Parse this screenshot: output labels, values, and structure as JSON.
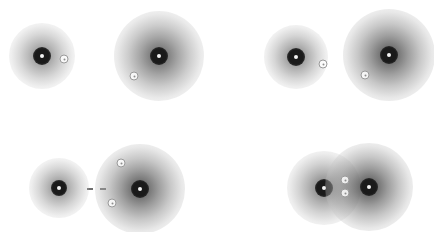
{
  "figure": {
    "width": 434,
    "height": 232,
    "background_color": "#ffffff",
    "colormap": "inverted-grayscale",
    "source_color": "#1a1a1a",
    "halo_color": "#bdbdbd",
    "marker_color": "#9a9a9a",
    "connector_color": "#6f6f6f"
  },
  "panels": [
    {
      "id": "panel-top-left",
      "sources": [
        {
          "name": "source-a1",
          "cx": 42,
          "cy": 56,
          "halo_r": 33,
          "core_r": 9,
          "nucleus_r": 2,
          "peak": 1.0,
          "halo_opacity": 0.55
        },
        {
          "name": "source-a2",
          "cx": 159,
          "cy": 56,
          "halo_r": 45,
          "core_r": 9,
          "nucleus_r": 2,
          "peak": 1.0,
          "halo_opacity": 0.72
        }
      ],
      "markers": [
        {
          "name": "marker-a1",
          "cx": 64,
          "cy": 59,
          "r": 4.5
        },
        {
          "name": "marker-a2",
          "cx": 134,
          "cy": 76,
          "r": 4.5
        }
      ],
      "connectors": []
    },
    {
      "id": "panel-top-right",
      "sources": [
        {
          "name": "source-b1",
          "cx": 296,
          "cy": 57,
          "halo_r": 32,
          "core_r": 9,
          "nucleus_r": 2,
          "peak": 1.0,
          "halo_opacity": 0.58
        },
        {
          "name": "source-b2",
          "cx": 389,
          "cy": 55,
          "halo_r": 46,
          "core_r": 9,
          "nucleus_r": 2,
          "peak": 1.0,
          "halo_opacity": 0.78
        }
      ],
      "markers": [
        {
          "name": "marker-b1",
          "cx": 323,
          "cy": 64,
          "r": 4.5
        },
        {
          "name": "marker-b2",
          "cx": 365,
          "cy": 75,
          "r": 4.5
        }
      ],
      "connectors": []
    },
    {
      "id": "panel-bottom-left",
      "sources": [
        {
          "name": "source-c1",
          "cx": 59,
          "cy": 188,
          "halo_r": 30,
          "core_r": 8,
          "nucleus_r": 2,
          "peak": 1.0,
          "halo_opacity": 0.55
        },
        {
          "name": "source-c2",
          "cx": 140,
          "cy": 189,
          "halo_r": 45,
          "core_r": 9,
          "nucleus_r": 2,
          "peak": 1.0,
          "halo_opacity": 0.78
        }
      ],
      "markers": [
        {
          "name": "marker-c1",
          "cx": 121,
          "cy": 163,
          "r": 4.5
        },
        {
          "name": "marker-c2",
          "cx": 112,
          "cy": 203,
          "r": 4.5
        }
      ],
      "connectors": [
        {
          "name": "connector-c",
          "x1": 87,
          "y1": 189,
          "x2": 106,
          "y2": 189
        }
      ]
    },
    {
      "id": "panel-bottom-right",
      "sources": [
        {
          "name": "source-d1",
          "cx": 324,
          "cy": 188,
          "halo_r": 37,
          "core_r": 9,
          "nucleus_r": 2,
          "peak": 1.0,
          "halo_opacity": 0.62
        },
        {
          "name": "source-d2",
          "cx": 369,
          "cy": 187,
          "halo_r": 44,
          "core_r": 9,
          "nucleus_r": 2,
          "peak": 1.0,
          "halo_opacity": 0.8
        }
      ],
      "markers": [
        {
          "name": "marker-d1",
          "cx": 345,
          "cy": 180,
          "r": 4.5
        },
        {
          "name": "marker-d2",
          "cx": 345,
          "cy": 193,
          "r": 4.5
        }
      ],
      "connectors": []
    }
  ]
}
